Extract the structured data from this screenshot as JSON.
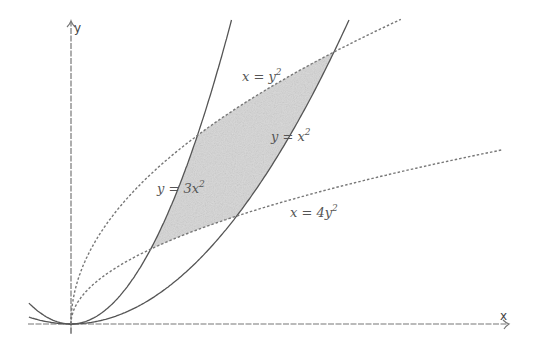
{
  "figure": {
    "type": "region-between-curves",
    "axes": {
      "x_label": "x",
      "y_label": "y",
      "origin_tick": "1"
    },
    "curves": [
      {
        "id": "c1",
        "equation": "y = 3x^2",
        "label_main": "y = 3x",
        "label_exp": "2",
        "style": "solid",
        "color": "#555555"
      },
      {
        "id": "c2",
        "equation": "y = x^2",
        "label_main": "y = x",
        "label_exp": "2",
        "style": "solid",
        "color": "#555555"
      },
      {
        "id": "c3",
        "equation": "x = y^2",
        "label_main": "x = y",
        "label_exp": "2",
        "style": "dashed",
        "color": "#777777"
      },
      {
        "id": "c4",
        "equation": "x = 4y^2",
        "label_main": "x = 4y",
        "label_exp": "2",
        "style": "dashed",
        "color": "#777777"
      }
    ],
    "shaded_region": {
      "fill": "#d9d9d9",
      "vertices": [
        {
          "x": 0.3029,
          "y": 0.2752
        },
        {
          "x": 0.63,
          "y": 0.3969
        },
        {
          "x": 1.0,
          "y": 1.0
        },
        {
          "x": 0.4807,
          "y": 0.6934
        }
      ]
    }
  }
}
